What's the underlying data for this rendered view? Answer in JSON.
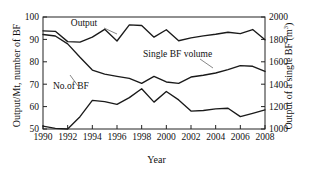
{
  "chart_data": {
    "type": "line",
    "title": "",
    "xlabel": "Year",
    "ylabel": "Output/Mt, number of BF",
    "ylabel_right": "Output of a single BF (m3)",
    "ylabel_right_prefix": "Output of a single BF (m",
    "ylabel_right_sup": "3",
    "ylabel_right_suffix": ")",
    "x": [
      1990,
      1991,
      1992,
      1993,
      1994,
      1995,
      1996,
      1997,
      1998,
      1999,
      2000,
      2001,
      2002,
      2003,
      2004,
      2005,
      2006,
      2007,
      2008
    ],
    "xlim": [
      1990,
      2008
    ],
    "xticks": [
      1990,
      1992,
      1994,
      1996,
      1998,
      2000,
      2002,
      2004,
      2006,
      2008
    ],
    "xticklabels": [
      "1990",
      "1992",
      "1994",
      "1996",
      "1998",
      "2000",
      "2002",
      "2004",
      "2006",
      "2008"
    ],
    "ylim": [
      50,
      100
    ],
    "yticks": [
      50,
      60,
      70,
      80,
      90,
      100
    ],
    "yticklabels": [
      "50",
      "60",
      "70",
      "80",
      "90",
      "100"
    ],
    "ylim_right": [
      1000,
      2000
    ],
    "yticks_right": [
      1000,
      1200,
      1400,
      1600,
      1800,
      2000
    ],
    "yticklabels_right": [
      "1000",
      "1200",
      "1400",
      "1600",
      "1800",
      "2000"
    ],
    "grid": false,
    "legend": "inline-annotations",
    "series": [
      {
        "name": "Output",
        "axis": "left",
        "label": "Output",
        "values": [
          93.8,
          93.6,
          89.0,
          88.8,
          91.0,
          94.5,
          89.3,
          96.5,
          96.2,
          91.0,
          94.3,
          89.4,
          90.7,
          91.6,
          92.3,
          93.2,
          92.6,
          94.4,
          89.8
        ]
      },
      {
        "name": "No.of BF",
        "axis": "left",
        "label": "No.of BF",
        "values": [
          92.2,
          91.5,
          88.0,
          82.0,
          76.3,
          74.5,
          73.5,
          72.6,
          70.4,
          73.5,
          71.0,
          70.4,
          73.2,
          74.0,
          75.0,
          76.5,
          78.3,
          78.0,
          75.7
        ]
      },
      {
        "name": "Single BF volume",
        "axis": "right",
        "label": "Single BF volume",
        "values": [
          1025,
          1005,
          1000,
          1110,
          1255,
          1245,
          1220,
          1280,
          1360,
          1240,
          1335,
          1260,
          1160,
          1165,
          1180,
          1185,
          1110,
          1140,
          1170
        ]
      }
    ],
    "annotations": [
      {
        "text": "Output",
        "x": 84,
        "y": 26
      },
      {
        "text": "Single BF volume",
        "x": 143,
        "y": 57
      },
      {
        "text": "No.of BF",
        "x": 53,
        "y": 89
      }
    ]
  }
}
